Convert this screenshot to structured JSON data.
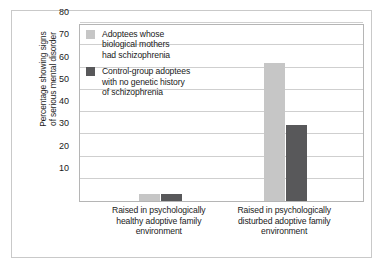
{
  "chart_data": {
    "type": "bar",
    "title": "",
    "xlabel": "",
    "ylabel": "Percentage showing signs\nof serious mental disorder",
    "categories": [
      "Raised in psychologically\nhealthy adoptive family\nenvironment",
      "Raised in psychologically\ndisturbed adoptive family\nenvironment"
    ],
    "series": [
      {
        "name": "Adoptees whose\nbiological mothers\nhad schizophrenia",
        "color": "#c6c6c6",
        "values": [
          3,
          62
        ]
      },
      {
        "name": "Control-group adoptees\nwith no genetic history\nof schizophrenia",
        "color": "#58585a",
        "values": [
          3,
          34
        ]
      }
    ],
    "ylim": [
      0,
      80
    ],
    "yticks": [
      10,
      20,
      30,
      40,
      50,
      60,
      70,
      80
    ],
    "ytick_labels": [
      "10",
      "20",
      "30",
      "40",
      "50",
      "60",
      "70",
      "80"
    ],
    "grid": true,
    "legend_position": "top-left"
  },
  "colors": {
    "light_bar": "#c6c6c6",
    "dark_bar": "#58585a",
    "gridline": "#cfcfcf",
    "frame": "#b5b5b5",
    "card_border": "#c9c9c9",
    "text": "#1a1a1a",
    "background": "#ffffff"
  }
}
